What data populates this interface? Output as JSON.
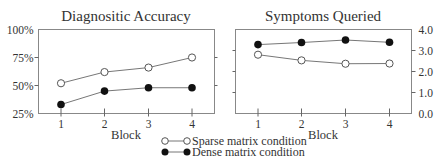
{
  "chart_data": [
    {
      "type": "line",
      "title": "Diagnositic Accuracy",
      "xlabel": "Block",
      "ylabel": "",
      "x": [
        1,
        2,
        3,
        4
      ],
      "xticks": [
        "1",
        "2",
        "3",
        "4"
      ],
      "ylim": [
        25,
        100
      ],
      "yticks": [
        25,
        50,
        75,
        100
      ],
      "ytick_labels": [
        "25%",
        "50%",
        "75%",
        "100%"
      ],
      "yaxis_side": "left",
      "grid": false,
      "series": [
        {
          "name": "Sparse matrix condition",
          "marker": "open-circle",
          "values": [
            52,
            62,
            66,
            75
          ]
        },
        {
          "name": "Dense matrix condition",
          "marker": "filled-circle",
          "values": [
            33,
            45,
            48,
            48
          ]
        }
      ]
    },
    {
      "type": "line",
      "title": "Symptoms Queried",
      "xlabel": "Block",
      "ylabel": "",
      "x": [
        1,
        2,
        3,
        4
      ],
      "xticks": [
        "1",
        "2",
        "3",
        "4"
      ],
      "ylim": [
        0.0,
        4.0
      ],
      "yticks": [
        0,
        1,
        2,
        3,
        4
      ],
      "ytick_labels": [
        "0.0",
        "1.0",
        "2.0",
        "3.0",
        "4.0"
      ],
      "yaxis_side": "right",
      "grid": false,
      "series": [
        {
          "name": "Sparse matrix condition",
          "marker": "open-circle",
          "values": [
            2.8,
            2.53,
            2.37,
            2.38
          ]
        },
        {
          "name": "Dense matrix condition",
          "marker": "filled-circle",
          "values": [
            3.28,
            3.38,
            3.5,
            3.39
          ]
        }
      ]
    }
  ],
  "legend": {
    "placement": "bottom-center",
    "items": [
      {
        "label": "Sparse matrix condition",
        "marker": "open-circle"
      },
      {
        "label": "Dense matrix condition",
        "marker": "filled-circle"
      }
    ]
  }
}
